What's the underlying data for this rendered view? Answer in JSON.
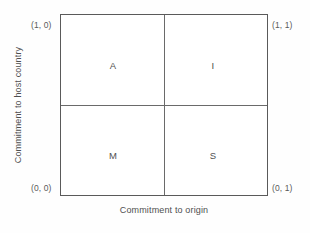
{
  "figure": {
    "type": "quadrant-matrix",
    "background_color": "#fefefe",
    "border_color": "#5a5a5a",
    "text_color": "#4f4f4f"
  },
  "axes": {
    "x_title": "Commitment to origin",
    "y_title": "Commitment to host country"
  },
  "corner_labels": {
    "top_left": "(1, 0)",
    "top_right": "(1, 1)",
    "bottom_left": "(0, 0)",
    "bottom_right": "(0, 1)"
  },
  "quadrants": [
    {
      "id": "top-left",
      "label": "A"
    },
    {
      "id": "top-right",
      "label": "I"
    },
    {
      "id": "bottom-left",
      "label": "M"
    },
    {
      "id": "bottom-right",
      "label": "S"
    }
  ],
  "chart_data": {
    "type": "table",
    "title": "",
    "xlabel": "Commitment to origin",
    "ylabel": "Commitment to host country",
    "xlim": [
      0,
      1
    ],
    "ylim": [
      0,
      1
    ],
    "grid": false,
    "legend": "none",
    "categories": [
      "A",
      "I",
      "M",
      "S"
    ],
    "cells": [
      {
        "label": "A",
        "x": 0,
        "y": 1,
        "corner_coordinate": "(1, 0)",
        "quadrant": "top-left",
        "commitment_to_origin": "low",
        "commitment_to_host_country": "high"
      },
      {
        "label": "I",
        "x": 1,
        "y": 1,
        "corner_coordinate": "(1, 1)",
        "quadrant": "top-right",
        "commitment_to_origin": "high",
        "commitment_to_host_country": "high"
      },
      {
        "label": "M",
        "x": 0,
        "y": 0,
        "corner_coordinate": "(0, 0)",
        "quadrant": "bottom-left",
        "commitment_to_origin": "low",
        "commitment_to_host_country": "low"
      },
      {
        "label": "S",
        "x": 1,
        "y": 0,
        "corner_coordinate": "(0, 1)",
        "quadrant": "bottom-right",
        "commitment_to_origin": "high",
        "commitment_to_host_country": "low"
      }
    ]
  }
}
